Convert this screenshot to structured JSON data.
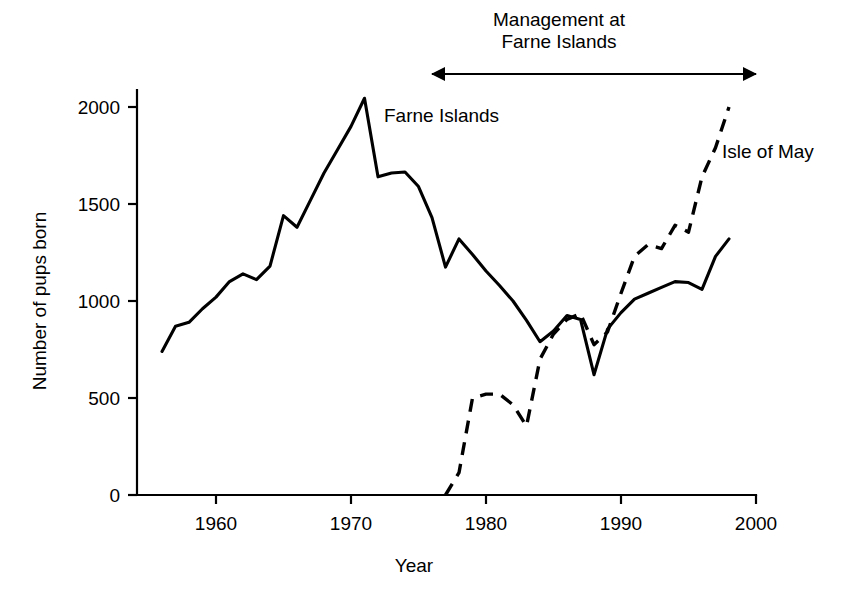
{
  "chart_data": {
    "type": "line",
    "title": "",
    "xlabel": "Year",
    "ylabel": "Number of pups born",
    "xlim": [
      1955,
      2000
    ],
    "ylim": [
      0,
      2150
    ],
    "xticks": [
      1960,
      1970,
      1980,
      1990,
      2000
    ],
    "xticklabels": [
      "1960",
      "1970",
      "1980",
      "1990",
      "2000"
    ],
    "yticks": [
      0,
      500,
      1000,
      1500,
      2000
    ],
    "yticklabels": [
      "0",
      "500",
      "1000",
      "1500",
      "2000"
    ],
    "grid": false,
    "legend_position": "inline-labels",
    "series": [
      {
        "name": "Farne Islands",
        "style": "solid",
        "label_text": "Farne Islands",
        "x": [
          1956,
          1957,
          1958,
          1959,
          1960,
          1961,
          1962,
          1963,
          1964,
          1965,
          1966,
          1967,
          1968,
          1969,
          1970,
          1971,
          1972,
          1973,
          1974,
          1975,
          1976,
          1977,
          1978,
          1979,
          1980,
          1981,
          1982,
          1983,
          1984,
          1985,
          1986,
          1987,
          1988,
          1989,
          1990,
          1991,
          1992,
          1993,
          1994,
          1995,
          1996,
          1997,
          1998
        ],
        "values": [
          740,
          870,
          890,
          960,
          1020,
          1100,
          1140,
          1110,
          1180,
          1440,
          1380,
          1520,
          1660,
          1780,
          1900,
          2045,
          1640,
          1660,
          1665,
          1590,
          1430,
          1175,
          1320,
          1240,
          1155,
          1080,
          1000,
          900,
          790,
          845,
          925,
          905,
          620,
          855,
          940,
          1010,
          1040,
          1070,
          1100,
          1095,
          1060,
          1230,
          1320
        ]
      },
      {
        "name": "Isle of May",
        "style": "dashed",
        "label_text": "Isle of May",
        "x": [
          1977,
          1978,
          1979,
          1980,
          1981,
          1982,
          1983,
          1984,
          1985,
          1986,
          1987,
          1988,
          1989,
          1990,
          1991,
          1992,
          1993,
          1994,
          1995,
          1996,
          1997,
          1998
        ],
        "values": [
          0,
          115,
          500,
          520,
          520,
          465,
          355,
          700,
          830,
          905,
          935,
          775,
          840,
          1040,
          1230,
          1290,
          1270,
          1390,
          1355,
          1640,
          1790,
          2000
        ]
      }
    ],
    "annotations": [
      {
        "name": "management-span",
        "text_lines": [
          "Management at",
          "Farne Islands"
        ],
        "arrow_from_year": 1979,
        "arrow_to_year": 2003,
        "double_headed": true
      }
    ]
  },
  "labels": {
    "farne_islands": "Farne Islands",
    "isle_of_may": "Isle of May",
    "management_line1": "Management at",
    "management_line2": "Farne Islands",
    "xaxis_title": "Year",
    "yaxis_title": "Number of pups born"
  },
  "colors": {
    "ink": "#000000",
    "background": "#ffffff"
  }
}
